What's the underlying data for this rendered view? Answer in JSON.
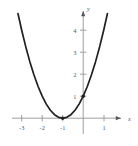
{
  "figure": {
    "title": "",
    "background_color": "#ffffff"
  },
  "chart_data": {
    "type": "line",
    "title": "",
    "xlabel": "x",
    "ylabel": "y",
    "function": "y = (x + 1)^2",
    "xlim": [
      -3.2,
      1.35
    ],
    "ylim": [
      -0.45,
      4.9
    ],
    "grid": false,
    "legend": null,
    "xticks": [
      -3,
      -2,
      -1,
      1
    ],
    "xticklabels": [
      "-3",
      "-2",
      "-1",
      "1"
    ],
    "yticks": [
      1,
      2,
      3,
      4
    ],
    "yticklabels": [
      "1",
      "2",
      "3",
      "4"
    ],
    "series": [
      {
        "name": "parabola",
        "color": "#231f20",
        "linewidth": 1.7,
        "x": [
          -3.18,
          -3.0,
          -2.8,
          -2.6,
          -2.4,
          -2.2,
          -2.0,
          -1.8,
          -1.6,
          -1.4,
          -1.2,
          -1.0,
          -0.8,
          -0.6,
          -0.4,
          -0.2,
          0.0,
          0.2,
          0.4,
          0.6,
          0.8,
          1.0,
          1.18
        ],
        "y": [
          4.75,
          4.0,
          3.24,
          2.56,
          1.96,
          1.44,
          1.0,
          0.64,
          0.36,
          0.16,
          0.04,
          0.0,
          0.04,
          0.16,
          0.36,
          0.64,
          1.0,
          1.44,
          1.96,
          2.56,
          3.24,
          4.0,
          4.75
        ]
      }
    ],
    "markers": [
      {
        "name": "vertex",
        "x": -1,
        "y": 0,
        "color": "#231f20"
      },
      {
        "name": "y-intercept",
        "x": 0,
        "y": 1,
        "color": "#231f20"
      }
    ],
    "axis_color": "#9b9ea1",
    "curve_color": "#231f20",
    "label_color": "#55585c"
  },
  "axis_labels": {
    "x": "x",
    "y": "y"
  },
  "x_tick_labels": [
    "-3",
    "-2",
    "-1",
    "1"
  ],
  "y_tick_labels": [
    "1",
    "2",
    "3",
    "4"
  ]
}
